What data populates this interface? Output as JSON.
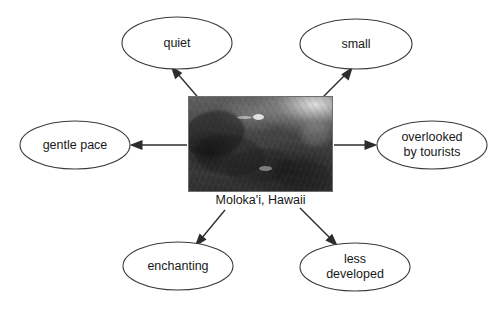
{
  "diagram": {
    "type": "concept-web",
    "center": {
      "caption": "Moloka'i, Hawaii",
      "image_alt": "aerial-photo-of-molokai-coastline"
    },
    "nodes": [
      {
        "id": "quiet",
        "label": "quiet",
        "lines": [
          "quiet"
        ],
        "cx": 177,
        "cy": 43,
        "rx": 55,
        "ry": 26
      },
      {
        "id": "small",
        "label": "small",
        "lines": [
          "small"
        ],
        "cx": 356,
        "cy": 44,
        "rx": 56,
        "ry": 25
      },
      {
        "id": "gentle",
        "label": "gentle pace",
        "lines": [
          "gentle pace"
        ],
        "cx": 75,
        "cy": 145,
        "rx": 55,
        "ry": 24
      },
      {
        "id": "overlooked",
        "label": "overlooked by tourists",
        "lines": [
          "overlooked",
          "by tourists"
        ],
        "cx": 432,
        "cy": 145,
        "rx": 55,
        "ry": 24
      },
      {
        "id": "enchanting",
        "label": "enchanting",
        "lines": [
          "enchanting"
        ],
        "cx": 178,
        "cy": 266,
        "rx": 55,
        "ry": 24
      },
      {
        "id": "less",
        "label": "less developed",
        "lines": [
          "less",
          "developed"
        ],
        "cx": 355,
        "cy": 267,
        "rx": 55,
        "ry": 24
      }
    ],
    "arrows": [
      {
        "id": "arrow-to-quiet",
        "from": "center",
        "to": "quiet"
      },
      {
        "id": "arrow-to-small",
        "from": "center",
        "to": "small"
      },
      {
        "id": "arrow-to-gentle",
        "from": "center",
        "to": "gentle"
      },
      {
        "id": "arrow-to-overlooked",
        "from": "center",
        "to": "overlooked"
      },
      {
        "id": "arrow-to-enchanting",
        "from": "center",
        "to": "enchanting"
      },
      {
        "id": "arrow-to-less",
        "from": "center",
        "to": "less"
      }
    ],
    "colors": {
      "background": "#ffffff",
      "node_stroke": "#3a3a3a",
      "node_fill": "#ffffff",
      "arrow": "#2d2d2d",
      "text": "#181818"
    }
  }
}
